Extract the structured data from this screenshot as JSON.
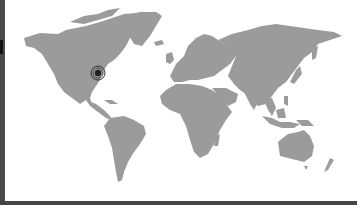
{
  "map": {
    "type": "world-map",
    "land_color": "#9b9b9b",
    "ocean_color": "#ffffff",
    "frame_color": "#4a4a4a",
    "marker": {
      "label": "Location marker",
      "icon": "target-pin-icon",
      "approx_region": "Eastern United States",
      "x": 98,
      "y": 73,
      "color": "#222222"
    }
  }
}
